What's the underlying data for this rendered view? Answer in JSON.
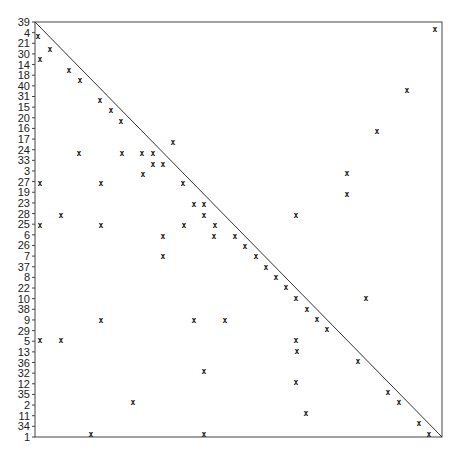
{
  "chart_data": {
    "type": "scatter",
    "title": "",
    "xlabel": "",
    "ylabel": "",
    "marker": "x",
    "grid": false,
    "legend": null,
    "diagonal_line": {
      "from": "top-left",
      "to": "bottom-right"
    },
    "y_tick_labels_top_to_bottom": [
      "39",
      "4",
      "21",
      "30",
      "14",
      "18",
      "40",
      "31",
      "15",
      "20",
      "16",
      "17",
      "24",
      "33",
      "3",
      "27",
      "19",
      "23",
      "28",
      "25",
      "6",
      "26",
      "7",
      "37",
      "8",
      "22",
      "10",
      "38",
      "9",
      "29",
      "5",
      "13",
      "36",
      "32",
      "12",
      "35",
      "2",
      "11",
      "34",
      "1"
    ],
    "x_tick_labels": [],
    "plot_box_px": {
      "left": 35,
      "top": 22,
      "right": 442,
      "bottom": 437
    },
    "points_px": [
      [
        38,
        36
      ],
      [
        50,
        49
      ],
      [
        40,
        59
      ],
      [
        69,
        70
      ],
      [
        80,
        80
      ],
      [
        100,
        100
      ],
      [
        111,
        110
      ],
      [
        121,
        121
      ],
      [
        173,
        142
      ],
      [
        79,
        153
      ],
      [
        122,
        153
      ],
      [
        142,
        153
      ],
      [
        153,
        153
      ],
      [
        153,
        164
      ],
      [
        163,
        164
      ],
      [
        143,
        174
      ],
      [
        40,
        183
      ],
      [
        101,
        183
      ],
      [
        183,
        183
      ],
      [
        194,
        204
      ],
      [
        204,
        204
      ],
      [
        61,
        215
      ],
      [
        204,
        215
      ],
      [
        296,
        215
      ],
      [
        40,
        225
      ],
      [
        101,
        225
      ],
      [
        184,
        225
      ],
      [
        215,
        225
      ],
      [
        163,
        236
      ],
      [
        214,
        236
      ],
      [
        235,
        236
      ],
      [
        245,
        246
      ],
      [
        256,
        256
      ],
      [
        163,
        256
      ],
      [
        266,
        267
      ],
      [
        276,
        277
      ],
      [
        286,
        287
      ],
      [
        296,
        298
      ],
      [
        366,
        298
      ],
      [
        307,
        309
      ],
      [
        317,
        319
      ],
      [
        327,
        329
      ],
      [
        101,
        320
      ],
      [
        194,
        320
      ],
      [
        225,
        320
      ],
      [
        40,
        340
      ],
      [
        61,
        340
      ],
      [
        296,
        340
      ],
      [
        297,
        351
      ],
      [
        358,
        361
      ],
      [
        204,
        371
      ],
      [
        296,
        382
      ],
      [
        388,
        392
      ],
      [
        399,
        402
      ],
      [
        133,
        402
      ],
      [
        306,
        413
      ],
      [
        419,
        423
      ],
      [
        429,
        434
      ],
      [
        91,
        434
      ],
      [
        204,
        434
      ],
      [
        435,
        29
      ],
      [
        407,
        90
      ],
      [
        377,
        131
      ],
      [
        347,
        173
      ],
      [
        347,
        194
      ]
    ]
  },
  "caption": ""
}
